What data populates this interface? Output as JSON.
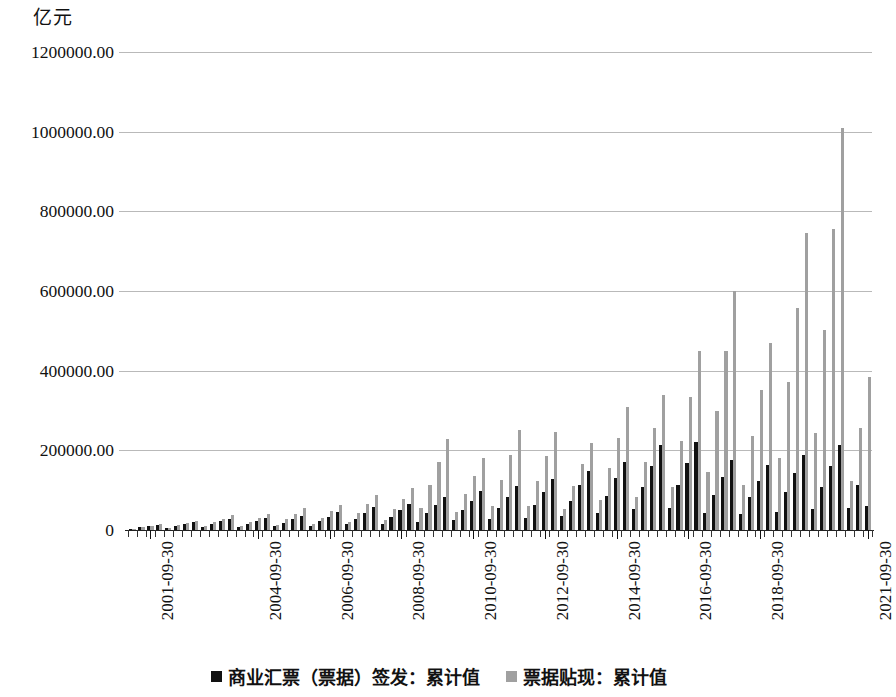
{
  "chart_data": {
    "type": "bar",
    "title": "",
    "subtitle": "",
    "unit_label": "亿元",
    "xlabel": "",
    "ylabel": "亿元",
    "ylim": [
      0,
      1200000
    ],
    "grid": true,
    "legend_position": "bottom",
    "y_ticks": [
      "0",
      "200000.00",
      "400000.00",
      "600000.00",
      "800000.00",
      "1000000.00",
      "1200000.00"
    ],
    "y_tick_values": [
      0,
      200000,
      400000,
      600000,
      800000,
      1000000,
      1200000
    ],
    "x_tick_labels": [
      "2001-09-30",
      "2004-09-30",
      "2006-09-30",
      "2008-09-30",
      "2010-09-30",
      "2012-09-30",
      "2014-09-30",
      "2016-09-30",
      "2018-09-30",
      "2021-09-30"
    ],
    "x_tick_label_indices": [
      2,
      14,
      22,
      30,
      38,
      46,
      54,
      62,
      70,
      82
    ],
    "colors": {
      "issue": "#111111",
      "discount": "#a0a0a0",
      "gridline": "#b9b9b9",
      "axis": "#222222"
    },
    "categories": [
      "2001-03-31",
      "2001-06-30",
      "2001-09-30",
      "2001-12-31",
      "2002-03-31",
      "2002-06-30",
      "2002-09-30",
      "2002-12-31",
      "2003-03-31",
      "2003-06-30",
      "2003-09-30",
      "2003-12-31",
      "2004-03-31",
      "2004-06-30",
      "2004-09-30",
      "2004-12-31",
      "2005-03-31",
      "2005-06-30",
      "2005-09-30",
      "2005-12-31",
      "2006-03-31",
      "2006-06-30",
      "2006-09-30",
      "2006-12-31",
      "2007-03-31",
      "2007-06-30",
      "2007-09-30",
      "2007-12-31",
      "2008-03-31",
      "2008-06-30",
      "2008-09-30",
      "2008-12-31",
      "2009-03-31",
      "2009-06-30",
      "2009-09-30",
      "2009-12-31",
      "2010-03-31",
      "2010-06-30",
      "2010-09-30",
      "2010-12-31",
      "2011-03-31",
      "2011-06-30",
      "2011-09-30",
      "2011-12-31",
      "2012-03-31",
      "2012-06-30",
      "2012-09-30",
      "2012-12-31",
      "2013-03-31",
      "2013-06-30",
      "2013-09-30",
      "2013-12-31",
      "2014-03-31",
      "2014-06-30",
      "2014-09-30",
      "2014-12-31",
      "2015-03-31",
      "2015-06-30",
      "2015-09-30",
      "2015-12-31",
      "2016-03-31",
      "2016-06-30",
      "2016-09-30",
      "2016-12-31",
      "2017-03-31",
      "2017-06-30",
      "2017-09-30",
      "2017-12-31",
      "2018-03-31",
      "2018-06-30",
      "2018-09-30",
      "2018-12-31",
      "2019-03-31",
      "2019-06-30",
      "2019-09-30",
      "2019-12-31",
      "2020-03-31",
      "2020-06-30",
      "2020-09-30",
      "2020-12-31",
      "2021-03-31",
      "2021-06-30",
      "2021-09-30"
    ],
    "series": [
      {
        "name": "商业汇票（票据）签发：累计值",
        "key": "issue",
        "color": "#111111",
        "values": [
          3000,
          6500,
          9500,
          13000,
          4500,
          9500,
          14500,
          19500,
          7000,
          14500,
          21500,
          28000,
          8000,
          16000,
          23500,
          30000,
          9000,
          18500,
          27500,
          36000,
          11000,
          22000,
          33000,
          44000,
          14000,
          28500,
          43000,
          58000,
          16000,
          33000,
          49000,
          65000,
          20000,
          42000,
          62000,
          82000,
          24000,
          49000,
          73000,
          97000,
          28000,
          56000,
          84000,
          110000,
          30000,
          62000,
          95000,
          127000,
          36000,
          74000,
          112000,
          148000,
          42000,
          86000,
          130000,
          172000,
          52000,
          108000,
          160000,
          213000,
          55000,
          112000,
          168000,
          221000,
          43000,
          88000,
          132000,
          176000,
          40000,
          82000,
          123000,
          164000,
          46000,
          95000,
          142000,
          189000,
          52000,
          107000,
          160000,
          213000,
          55000,
          112000,
          60000
        ]
      },
      {
        "name": "票据贴现：累计值",
        "key": "discount",
        "color": "#a0a0a0",
        "values": [
          3500,
          7500,
          11000,
          15000,
          5500,
          11500,
          17500,
          23500,
          9000,
          19000,
          28000,
          37000,
          10000,
          21000,
          31000,
          41000,
          13000,
          27000,
          41000,
          55000,
          15000,
          31000,
          47000,
          63000,
          21000,
          43000,
          65000,
          88000,
          25000,
          52000,
          78000,
          105000,
          55000,
          114000,
          170000,
          228000,
          44000,
          91000,
          136000,
          181000,
          61000,
          126000,
          188000,
          250000,
          60000,
          124000,
          186000,
          246000,
          53000,
          110000,
          165000,
          219000,
          75000,
          155000,
          232000,
          310000,
          82000,
          170000,
          255000,
          340000,
          108000,
          223000,
          335000,
          450000,
          145000,
          300000,
          450000,
          600000,
          113000,
          235000,
          352000,
          470000,
          180000,
          372000,
          558000,
          745000,
          243000,
          503000,
          755000,
          1010000,
          124000,
          257000,
          385000
        ]
      }
    ]
  },
  "legend": {
    "items": [
      {
        "label": "商业汇票（票据）签发：累计值",
        "color_key": "issue"
      },
      {
        "label": "票据贴现：累计值",
        "color_key": "discount"
      }
    ]
  }
}
